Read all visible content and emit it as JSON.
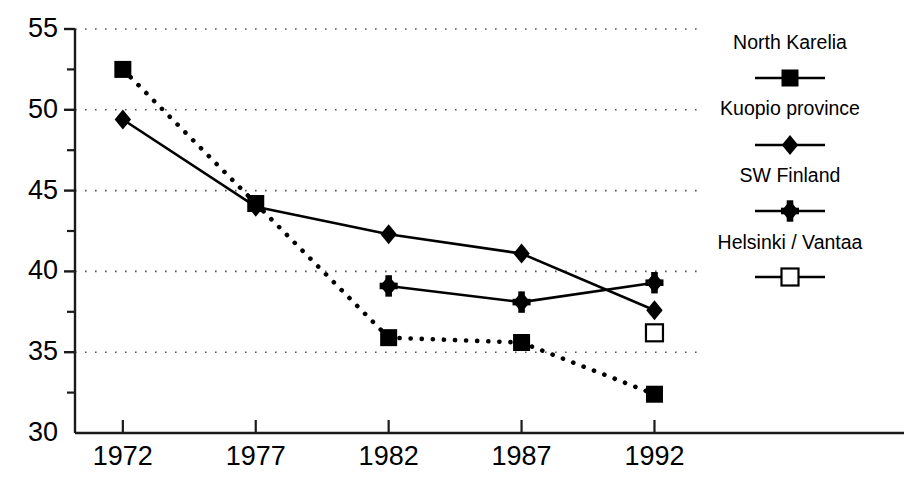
{
  "chart_data": {
    "type": "line",
    "title": "",
    "subtitle": "",
    "xlabel": "",
    "ylabel": "",
    "x": [
      1972,
      1977,
      1982,
      1987,
      1992
    ],
    "xtick_labels": [
      "1972",
      "1977",
      "1982",
      "1987",
      "1992"
    ],
    "ytick_labels": [
      "30",
      "35",
      "40",
      "45",
      "50",
      "55"
    ],
    "yticks": [
      30,
      35,
      40,
      45,
      50,
      55
    ],
    "minor_yticks": [
      32.5,
      37.5,
      42.5,
      47.5,
      52.5
    ],
    "ylim": [
      30,
      55
    ],
    "xlim": [
      1970.2,
      1993.6
    ],
    "grid": "horizontal-dotted",
    "legend_position": "right",
    "series": [
      {
        "name": "North Karelia",
        "marker": "filled-square",
        "line_style": "dotted",
        "color": "#000000",
        "x": [
          1972,
          1977,
          1982,
          1987,
          1992
        ],
        "values": [
          52.5,
          44.2,
          35.9,
          35.6,
          32.4
        ]
      },
      {
        "name": "Kuopio province",
        "marker": "filled-diamond",
        "line_style": "solid",
        "color": "#000000",
        "x": [
          1972,
          1977,
          1982,
          1987,
          1992
        ],
        "values": [
          49.4,
          44.0,
          42.3,
          41.1,
          37.6
        ]
      },
      {
        "name": "SW Finland",
        "marker": "filled-star-diamond",
        "line_style": "solid",
        "color": "#000000",
        "x": [
          1982,
          1987,
          1992
        ],
        "values": [
          39.1,
          38.1,
          39.3
        ]
      },
      {
        "name": "Helsinki / Vantaa",
        "marker": "open-square",
        "line_style": "none",
        "color": "#000000",
        "x": [
          1992
        ],
        "values": [
          36.2
        ]
      }
    ]
  },
  "axis": {
    "y_labels": [
      {
        "text": "55",
        "value": 55
      },
      {
        "text": "50",
        "value": 50
      },
      {
        "text": "45",
        "value": 45
      },
      {
        "text": "40",
        "value": 40
      },
      {
        "text": "35",
        "value": 35
      },
      {
        "text": "30",
        "value": 30
      }
    ],
    "x_labels": [
      {
        "text": "1972",
        "value": 1972
      },
      {
        "text": "1977",
        "value": 1977
      },
      {
        "text": "1982",
        "value": 1982
      },
      {
        "text": "1987",
        "value": 1987
      },
      {
        "text": "1992",
        "value": 1992
      }
    ]
  },
  "legend": {
    "items": [
      {
        "label": "North Karelia",
        "marker": "filled-square",
        "line_style": "solid"
      },
      {
        "label": "Kuopio province",
        "marker": "filled-diamond",
        "line_style": "solid"
      },
      {
        "label": "SW Finland",
        "marker": "filled-star-diamond",
        "line_style": "solid"
      },
      {
        "label": "Helsinki / Vantaa",
        "marker": "open-square",
        "line_style": "solid"
      }
    ]
  },
  "style": {
    "axis_color": "#1a1a1a",
    "grid_color": "#555555",
    "series_color": "#000000",
    "background": "#ffffff"
  }
}
